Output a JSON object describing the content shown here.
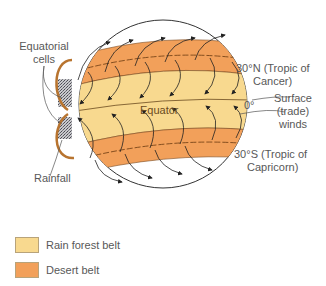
{
  "diagram": {
    "labels": {
      "equatorial_cells": [
        "Equatorial",
        "cells"
      ],
      "rainfall": "Rainfall",
      "equator": "Equator",
      "zero_degree": "0°",
      "tropic_cancer": [
        "30°N (Tropic of",
        "Cancer)"
      ],
      "surface_winds": [
        "Surface",
        "(trade)",
        "winds"
      ],
      "tropic_capricorn": [
        "30°S (Tropic of",
        "Capricorn)"
      ]
    },
    "colors": {
      "rain_forest": "#f8d98f",
      "desert": "#f2a05a",
      "outline": "#333333",
      "rain_cell": "#9a9aa0",
      "loop": "#b8742f"
    }
  },
  "legend": {
    "items": [
      {
        "label": "Rain forest belt",
        "color": "#f8d98f"
      },
      {
        "label": "Desert belt",
        "color": "#f2a05a"
      }
    ]
  }
}
